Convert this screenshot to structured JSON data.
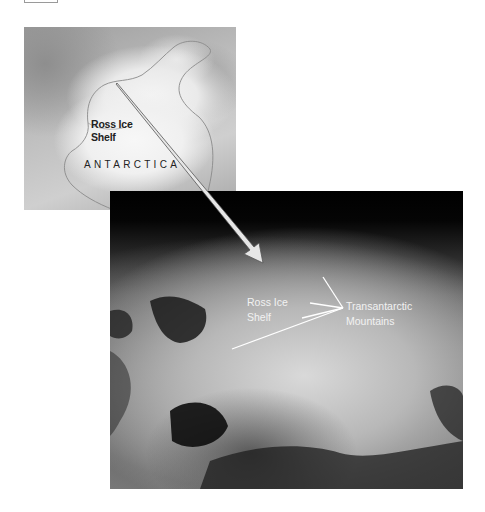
{
  "figure": {
    "map": {
      "labels": {
        "ross_ice_shelf_line1": "Ross Ice",
        "ross_ice_shelf_line2": "Shelf",
        "continent": "ANTARCTICA"
      }
    },
    "photo": {
      "labels": {
        "ross_ice_shelf_line1": "Ross Ice",
        "ross_ice_shelf_line2": "Shelf",
        "mountains_line1": "Transantarctic",
        "mountains_line2": "Mountains"
      }
    },
    "arrow": {
      "from": "Ross Ice Shelf (map)",
      "to": "Ross Ice Shelf (satellite photo)"
    },
    "colors": {
      "background": "#ffffff",
      "map_text": "#222222",
      "photo_text": "#f2f2f2",
      "arrow_fill": "#e6e6e6",
      "leader_lines": "#ffffff"
    }
  }
}
